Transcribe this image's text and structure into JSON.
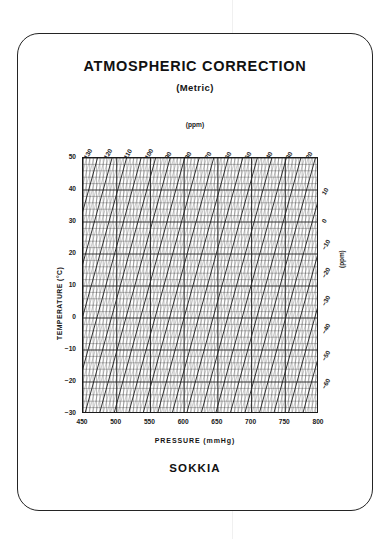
{
  "card": {
    "brand": "SOKKIA"
  },
  "header": {
    "title": "ATMOSPHERIC CORRECTION",
    "subtitle": "(Metric)"
  },
  "chart_data": {
    "type": "line",
    "title": "ATMOSPHERIC CORRECTION",
    "subtitle": "(Metric)",
    "xlabel": "PRESSURE (mmHg)",
    "ylabel": "TEMPERATURE (°C)",
    "top_axis_label": "(ppm)",
    "right_axis_label": "(ppm)",
    "xlim": [
      450,
      800
    ],
    "ylim": [
      -30,
      50
    ],
    "grid": true,
    "legend": "none",
    "xticks": [
      450,
      500,
      550,
      600,
      650,
      700,
      750,
      800
    ],
    "yticks": [
      50,
      40,
      30,
      20,
      10,
      0,
      "-10",
      "-20",
      "-30"
    ],
    "top_ticks": [
      130,
      120,
      110,
      100,
      90,
      80,
      70,
      60,
      50,
      40,
      30,
      20
    ],
    "right_ticks": [
      10,
      0,
      "-10",
      "-20",
      "-30",
      "-40",
      "-50",
      "-60"
    ],
    "x_minor_step": 5,
    "y_minor_step": 2,
    "ppm_lines": {
      "count": 27,
      "step": 10,
      "range": [
        -60,
        130
      ],
      "orientation": "steep diagonals rising to the right"
    }
  }
}
